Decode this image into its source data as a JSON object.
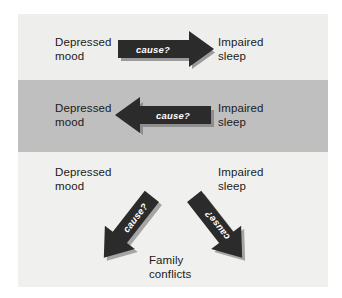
{
  "figure": {
    "title": "",
    "colors": {
      "page_background": "#ffffff",
      "panel_background": "#f0f0ee",
      "band_top_background": "#eeeeec",
      "band_middle_background": "#bfbfbf",
      "band_bottom_background": "#f0f0ee",
      "arrow_fill": "#2b2b2b",
      "arrow_shadow": "#9a9a9a",
      "arrow_label_color": "#ffffff",
      "text_color": "#1b1b1b"
    }
  },
  "diagram": {
    "type": "causal-relationship-panels",
    "panels": [
      {
        "id": "panel-1",
        "shaded": false,
        "nodes": [
          {
            "id": "depressed-mood-1",
            "label": "Depressed\nmood",
            "position": "left"
          },
          {
            "id": "impaired-sleep-1",
            "label": "Impaired\nsleep",
            "position": "right"
          }
        ],
        "arrows": [
          {
            "id": "arrow-1",
            "label": "cause?",
            "from": "depressed-mood-1",
            "to": "impaired-sleep-1",
            "direction": "right"
          }
        ]
      },
      {
        "id": "panel-2",
        "shaded": true,
        "nodes": [
          {
            "id": "depressed-mood-2",
            "label": "Depressed\nmood",
            "position": "left"
          },
          {
            "id": "impaired-sleep-2",
            "label": "Impaired\nsleep",
            "position": "right"
          }
        ],
        "arrows": [
          {
            "id": "arrow-2",
            "label": "cause?",
            "from": "impaired-sleep-2",
            "to": "depressed-mood-2",
            "direction": "left"
          }
        ]
      },
      {
        "id": "panel-3",
        "shaded": false,
        "nodes": [
          {
            "id": "depressed-mood-3",
            "label": "Depressed\nmood",
            "position": "top-left"
          },
          {
            "id": "impaired-sleep-3",
            "label": "Impaired\nsleep",
            "position": "top-right"
          },
          {
            "id": "family-conflicts",
            "label": "Family\nconflicts",
            "position": "bottom-center"
          }
        ],
        "arrows": [
          {
            "id": "arrow-3",
            "label": "cause?",
            "from": "family-conflicts",
            "to": "depressed-mood-3",
            "direction": "up-left"
          },
          {
            "id": "arrow-4",
            "label": "cause?",
            "from": "family-conflicts",
            "to": "impaired-sleep-3",
            "direction": "up-right"
          }
        ]
      }
    ]
  },
  "labels": {
    "depressed_mood": "Depressed\nmood",
    "impaired_sleep": "Impaired\nsleep",
    "family_conflicts": "Family\nconflicts",
    "cause": "cause?"
  }
}
